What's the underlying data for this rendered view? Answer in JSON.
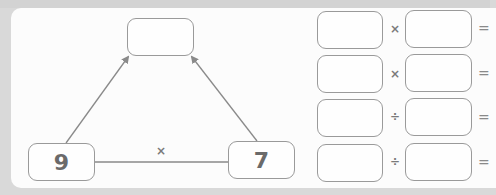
{
  "triangle": {
    "top_box": {
      "value": ""
    },
    "left_box": {
      "value": "9"
    },
    "right_box": {
      "value": "7"
    },
    "base_operator": "×"
  },
  "equations": [
    {
      "left": "",
      "operator": "×",
      "right": "",
      "equals": "="
    },
    {
      "left": "",
      "operator": "×",
      "right": "",
      "equals": "="
    },
    {
      "left": "",
      "operator": "÷",
      "right": "",
      "equals": "="
    },
    {
      "left": "",
      "operator": "÷",
      "right": "",
      "equals": "="
    }
  ],
  "colors": {
    "border": "#9a9a9a",
    "text": "#6a6a6a",
    "panel": "#fcfcfc",
    "background": "#d9d9d9"
  }
}
